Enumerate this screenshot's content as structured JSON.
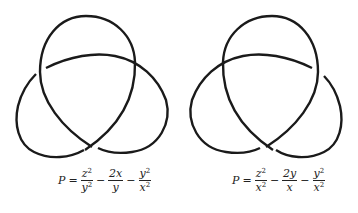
{
  "figure": {
    "left": {
      "label": "left-handed trefoil",
      "formula": {
        "lhs": "P",
        "eq": "=",
        "terms": [
          {
            "num": "z",
            "num_exp": "2",
            "den": "y",
            "den_exp": "2",
            "sign": ""
          },
          {
            "num": "2x",
            "num_exp": "",
            "den": "y",
            "den_exp": "",
            "sign": "−"
          },
          {
            "num": "y",
            "num_exp": "2",
            "den": "x",
            "den_exp": "2",
            "sign": "−"
          }
        ]
      }
    },
    "right": {
      "label": "right-handed trefoil",
      "formula": {
        "lhs": "P",
        "eq": "=",
        "terms": [
          {
            "num": "z",
            "num_exp": "2",
            "den": "x",
            "den_exp": "2",
            "sign": ""
          },
          {
            "num": "2y",
            "num_exp": "",
            "den": "x",
            "den_exp": "",
            "sign": "−"
          },
          {
            "num": "y",
            "num_exp": "2",
            "den": "x",
            "den_exp": "2",
            "sign": "−"
          }
        ]
      }
    },
    "stroke_color": "#1a1a1a"
  }
}
